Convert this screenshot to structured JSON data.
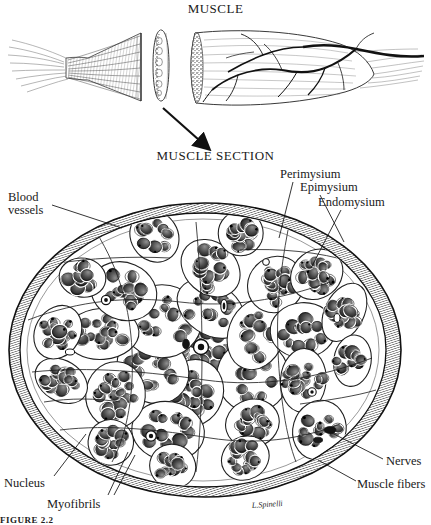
{
  "figure": {
    "kind": "anatomical-illustration",
    "style": "pen-and-ink stipple engraving, black and white",
    "caption": "FIGURE 2.2",
    "signature": "L.Spinelli"
  },
  "titles": {
    "top": "MUSCLE",
    "section": "MUSCLE SECTION"
  },
  "labels": {
    "blood_vessels": "Blood\nvessels",
    "blood_vessels_line1": "Blood",
    "blood_vessels_line2": "vessels",
    "perimysium": "Perimysium",
    "epimysium": "Epimysium",
    "endomysium": "Endomysium",
    "nucleus": "Nucleus",
    "myofibrils": "Myofibrils",
    "nerves": "Nerves",
    "muscle_fibers": "Muscle fibers"
  },
  "colors": {
    "ink": "#111111",
    "paper": "#ffffff",
    "mid_gray": "#6b6b6b",
    "light_gray": "#bdbdbd"
  },
  "top_panel": {
    "parts": [
      {
        "name": "muscle-belly-left",
        "description": "tapering cut muscle belly with tendon fibers at left end"
      },
      {
        "name": "muscle-slice",
        "description": "thin transverse slice with stippled cut face"
      },
      {
        "name": "muscle-belly-right",
        "description": "muscle belly with branching nerves and blood vessels on surface"
      }
    ],
    "arrow": {
      "name": "down-arrow",
      "from_part": "muscle-slice",
      "to": "MUSCLE SECTION"
    }
  },
  "section_panel": {
    "shape": "ellipse",
    "fascicle_count": 26,
    "structures": [
      "epimysium outer hatched sheath",
      "perimysium septa dividing fascicles",
      "endomysium around individual fibers",
      "blood vessels within septa",
      "nerves at lower right",
      "muscle fiber nuclei at periphery of fibers"
    ]
  }
}
